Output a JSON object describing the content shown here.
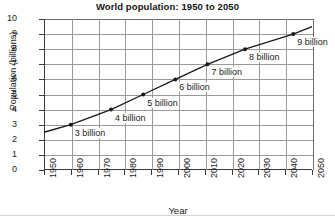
{
  "chart_data": {
    "type": "line",
    "title": "World population: 1950 to 2050",
    "xlabel": "Year",
    "ylabel": "Population (billions)",
    "xlim": [
      1950,
      2050
    ],
    "ylim": [
      0,
      10
    ],
    "grid": true,
    "legend": "none",
    "xticks": [
      "1950",
      "1960",
      "1970",
      "1980",
      "1990",
      "2000",
      "2010",
      "2020",
      "2030",
      "2040",
      "2050"
    ],
    "yticks": [
      "0",
      "1",
      "2",
      "3",
      "4",
      "5",
      "6",
      "7",
      "8",
      "9",
      "10"
    ],
    "x": [
      1950,
      1960,
      1975,
      1987,
      1999,
      2011,
      2025,
      2043,
      2050
    ],
    "values": [
      2.5,
      3,
      4,
      5,
      6,
      7,
      8,
      9,
      9.5
    ],
    "markers": [
      {
        "x": 1960,
        "y": 3,
        "label": "3 billion"
      },
      {
        "x": 1975,
        "y": 4,
        "label": "4 billion"
      },
      {
        "x": 1987,
        "y": 5,
        "label": "5 billion"
      },
      {
        "x": 1999,
        "y": 6,
        "label": "6 billion"
      },
      {
        "x": 2011,
        "y": 7,
        "label": "7 billion"
      },
      {
        "x": 2025,
        "y": 8,
        "label": "8 billion"
      },
      {
        "x": 2043,
        "y": 9,
        "label": "9 billion"
      }
    ],
    "line_color": "#1a1a1a",
    "grid_color": "#9a9a9a",
    "axis_color": "#3a3a3a"
  }
}
